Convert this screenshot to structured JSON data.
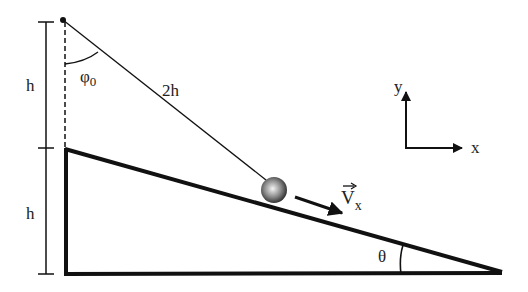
{
  "diagram": {
    "labels": {
      "upper_height": "h",
      "lower_height": "h",
      "string_length": "2h",
      "initial_angle": "φ",
      "initial_angle_sub": "0",
      "velocity": "V",
      "velocity_sub": "x",
      "velocity_vector_mark": "→",
      "incline_angle": "θ",
      "axis_y": "y",
      "axis_x": "x"
    },
    "colors": {
      "stroke": "#111111",
      "ball_light": "#f4f4f4",
      "ball_dark": "#222222",
      "background": "#ffffff"
    },
    "geometry": {
      "pivot": [
        63,
        20
      ],
      "incline_top": [
        65,
        148
      ],
      "incline_corner": [
        66,
        274
      ],
      "incline_tip": [
        502,
        272
      ],
      "ball_center": [
        274,
        190
      ],
      "ball_radius": 13
    }
  }
}
